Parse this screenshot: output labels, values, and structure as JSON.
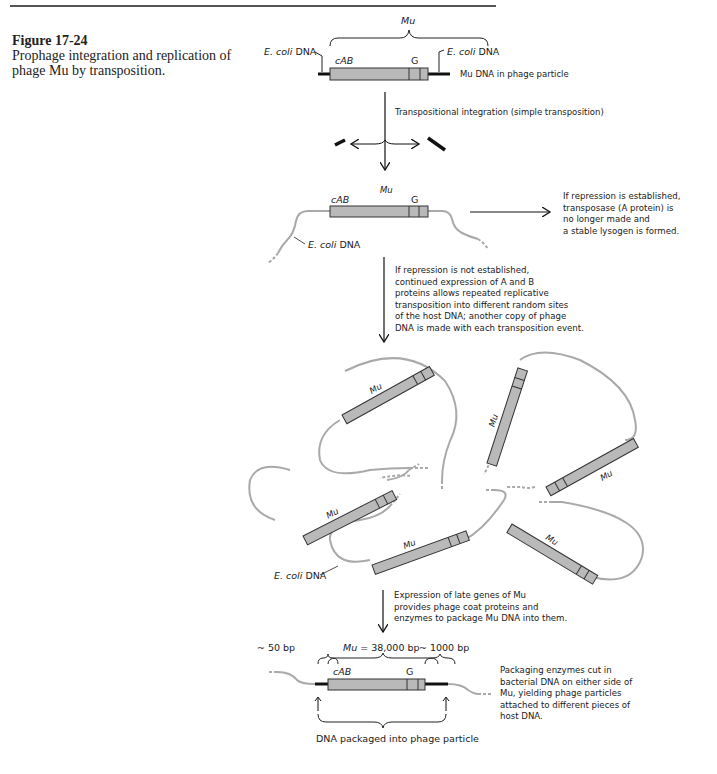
{
  "figure": {
    "number": "Figure 17-24",
    "caption": "Prophage integration and replication of phage Mu by transposition."
  },
  "colors": {
    "mu_box_fill": "#b9b9b9",
    "mu_box_stroke": "#333333",
    "host_dna": "#a9a9a9",
    "black_dna": "#111111",
    "text": "#1a1a1a"
  },
  "panel1": {
    "mu_label": "Mu",
    "left_host_label_italic": "E. coli",
    "left_host_label_rest": " DNA",
    "right_host_label_italic": "E. coli",
    "right_host_label_rest": " DNA",
    "cab_label": "cAB",
    "g_label": "G",
    "side_label": "Mu DNA in phage particle"
  },
  "step1": {
    "label": "Transpositional integration (simple transposition)"
  },
  "panel2": {
    "mu_label": "Mu",
    "cab_label": "cAB",
    "g_label": "G",
    "host_label_italic": "E. coli",
    "host_label_rest": " DNA",
    "repression_note": "If repression is established,\ntransposase (A protein) is\nno longer made and\na stable lysogen is formed."
  },
  "step2": {
    "label": "If repression is not established,\ncontinued expression of A and B\nproteins allows repeated replicative\ntransposition into different random sites\nof the host DNA; another copy of phage\nDNA is made with each transposition event."
  },
  "panel3": {
    "mu_copies": [
      "Mu",
      "Mu",
      "Mu",
      "Mu",
      "Mu",
      "Mu"
    ],
    "host_label_italic": "E. coli",
    "host_label_rest": " DNA"
  },
  "step3": {
    "label": "Expression of late genes of Mu\nprovides phage coat proteins and\nenzymes to package Mu DNA into them."
  },
  "panel4": {
    "left_flank": "~ 50 bp",
    "mu_size_italic": "Mu",
    "mu_size_rest": " = 38,000 bp",
    "right_flank": "~ 1000 bp",
    "cab_label": "cAB",
    "g_label": "G",
    "packaged_label": "DNA packaged into phage particle",
    "packaging_note": "Packaging enzymes cut in\nbacterial DNA on either side of\nMu, yielding phage particles\nattached to different pieces of\nhost DNA."
  }
}
